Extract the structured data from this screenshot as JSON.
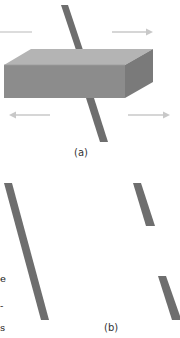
{
  "figure": {
    "panel_a": {
      "label": "(a)",
      "elements": [
        "block",
        "inclined-rod",
        "arrow-top-right",
        "arrow-bottom-left",
        "arrow-bottom-right",
        "line-top-left"
      ]
    },
    "panel_b": {
      "label": "(b)",
      "elements": [
        "continuous-rod",
        "broken-rod-upper",
        "broken-rod-lower"
      ]
    },
    "colors": {
      "rod": "#6e6e6e",
      "block_front": "#8c8c8c",
      "block_top": "#b4b4b4",
      "block_side": "#7a7a7a",
      "arrow": "#c8c8c8",
      "background": "#ffffff"
    },
    "margin_fragments": [
      "e",
      "-",
      "s"
    ]
  }
}
